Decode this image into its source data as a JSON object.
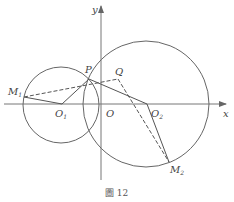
{
  "figure": {
    "caption": "圖 12",
    "axes": {
      "x_label": "x",
      "y_label": "y",
      "origin_label": "O"
    },
    "points": {
      "P": "P",
      "Q": "Q",
      "O1": {
        "base": "O",
        "sub": "1"
      },
      "O2": {
        "base": "O",
        "sub": "2"
      },
      "M1": {
        "base": "M",
        "sub": "1"
      },
      "M2": {
        "base": "M",
        "sub": "2"
      }
    },
    "circles": [
      "circle O1",
      "circle O2"
    ],
    "segments": {
      "solid": [
        "M1-O1",
        "O1-P",
        "P-O2",
        "O2-M2"
      ],
      "dashed": [
        "M1-Q",
        "Q-M2"
      ]
    },
    "colors": {
      "stroke": "#555555",
      "text": "#444444"
    }
  }
}
